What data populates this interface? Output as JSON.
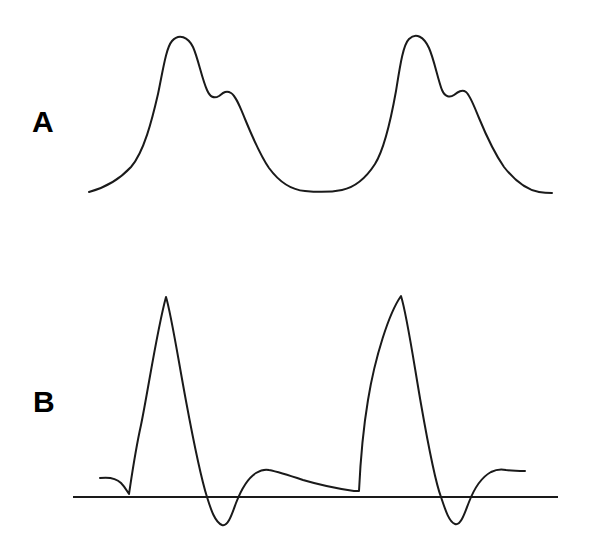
{
  "figure": {
    "type": "scientific-line-figure",
    "background_color": "#ffffff",
    "stroke_color": "#1a1a1a",
    "width": 589,
    "height": 543,
    "panel_count": 2
  },
  "panels": [
    {
      "id": "panel-a",
      "label": "A",
      "label_position": {
        "x": 32,
        "y": 132
      },
      "description": "Smooth bimodal waveform with shoulder on each main peak",
      "has_baseline": false
    },
    {
      "id": "panel-b",
      "label": "B",
      "label_position": {
        "x": 33,
        "y": 412
      },
      "description": "Sharp biphasic spike waveform with negative troughs, plotted against a horizontal zero baseline",
      "has_baseline": true
    }
  ],
  "chart_data": {
    "type": "line",
    "title": "",
    "subtitle": "",
    "xlabel": "",
    "ylabel": "",
    "grid": false,
    "legend": "none",
    "axis_ticks": "none",
    "tick_labels": [],
    "annotations": [
      "A",
      "B"
    ],
    "panels": [
      {
        "name": "A",
        "label": "A",
        "baseline": null,
        "xlim": [
          89,
          552
        ],
        "ylim": [
          38,
          193
        ],
        "features": [
          {
            "kind": "start",
            "x": 89,
            "y": 192
          },
          {
            "kind": "peak",
            "x": 172,
            "y": 40
          },
          {
            "kind": "shoulder-min",
            "x": 211,
            "y": 96
          },
          {
            "kind": "shoulder-bump",
            "x": 224,
            "y": 92
          },
          {
            "kind": "valley",
            "x": 325,
            "y": 191
          },
          {
            "kind": "peak",
            "x": 407,
            "y": 38
          },
          {
            "kind": "shoulder-min",
            "x": 445,
            "y": 96
          },
          {
            "kind": "shoulder-bump",
            "x": 460,
            "y": 93
          },
          {
            "kind": "end",
            "x": 552,
            "y": 193
          }
        ],
        "path": "M 89 192 C 104 188 118 181 131 167 C 144 152 152 120 158 94 C 163 70 166 48 172 41 C 179 33 188 37 193 47 C 198 58 202 79 207 90 C 210 97 214 99 219 96 C 223 93 226 90 231 93 C 236 96 240 107 245 119 C 252 136 260 155 269 168 C 280 183 292 190 305 191 C 315 192 332 192 342 190 C 356 187 366 178 375 164 C 385 148 391 119 396 91 C 400 66 403 45 409 39 C 416 32 424 37 429 48 C 434 59 438 80 442 90 C 445 97 450 98 454 95 C 458 92 462 89 466 92 C 470 95 474 106 479 118 C 486 135 495 154 504 167 C 515 181 527 190 539 192 C 545 193 549 193 552 193"
      },
      {
        "name": "B",
        "label": "B",
        "baseline": {
          "y": 497,
          "x_start": 73,
          "x_end": 558
        },
        "xlim": [
          100,
          525
        ],
        "ylim": [
          295,
          525
        ],
        "features": [
          {
            "kind": "start",
            "x": 100,
            "y": 478
          },
          {
            "kind": "pre-dip",
            "x": 128,
            "y": 494
          },
          {
            "kind": "spike-peak",
            "x": 166,
            "y": 296
          },
          {
            "kind": "zero-cross-down",
            "x": 207,
            "y": 497
          },
          {
            "kind": "trough",
            "x": 222,
            "y": 525
          },
          {
            "kind": "zero-cross-up",
            "x": 234,
            "y": 497
          },
          {
            "kind": "hump-peak",
            "x": 268,
            "y": 470
          },
          {
            "kind": "slow-decline",
            "x": 358,
            "y": 491
          },
          {
            "kind": "spike-peak",
            "x": 401,
            "y": 295
          },
          {
            "kind": "zero-cross-down",
            "x": 441,
            "y": 497
          },
          {
            "kind": "trough",
            "x": 455,
            "y": 524
          },
          {
            "kind": "zero-cross-up",
            "x": 464,
            "y": 497
          },
          {
            "kind": "hump-peak",
            "x": 505,
            "y": 470
          },
          {
            "kind": "end",
            "x": 525,
            "y": 471
          }
        ],
        "path": "M 100 478 C 108 477 116 478 121 483 C 125 487 127 491 129 494 C 131 481 135 452 141 425 C 148 391 157 330 166 297 C 171 313 178 358 186 401 C 194 444 201 478 207 497 C 211 510 215 522 222 525 C 228 527 232 514 236 503 C 241 490 248 478 256 473 C 261 470 265 469 269 470 C 279 472 291 476 303 480 C 320 485 340 489 354 491 C 357 491 358 491 359 491 C 360 470 363 430 368 400 C 375 357 389 313 401 296 C 407 315 414 364 421 404 C 428 444 435 481 441 497 C 445 509 449 522 455 524 C 461 526 465 512 469 502 C 474 489 482 477 491 472 C 497 469 502 469 506 470 C 513 471 520 471 525 471"
      }
    ]
  }
}
